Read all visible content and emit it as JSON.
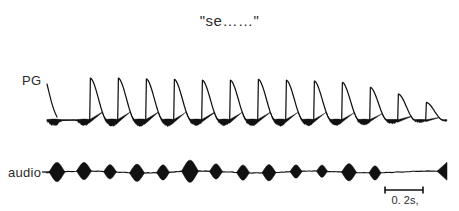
{
  "figure": {
    "title": "\"se……\"",
    "background_color": "#ffffff",
    "ink_color": "#111111",
    "traces": [
      {
        "name": "PG",
        "label": "PG",
        "type": "photoglottogram",
        "cycle_count": 14
      },
      {
        "name": "audio",
        "label": "audio",
        "type": "acoustic-waveform",
        "burst_count": 13
      }
    ],
    "scale_bar": {
      "label": "0. 2s,",
      "duration_seconds": 0.2,
      "x_start": 385,
      "x_end": 423,
      "y": 190
    }
  },
  "chart_data": {
    "type": "line",
    "title": "\"se……\"",
    "xlabel": "",
    "ylabel": "",
    "grid": false,
    "legend": "none",
    "x_scale_note": "0.2 s reference bar spans 38 px near right edge",
    "series": [
      {
        "name": "PG",
        "label": "PG",
        "baseline_y": 120,
        "peak_y": 78,
        "x_start": 47,
        "x_end": 447,
        "cycle_period_px": 28.5,
        "peak_x": [
          62,
          90,
          118,
          146,
          174,
          202,
          230,
          258,
          286,
          314,
          342,
          370,
          398,
          426
        ],
        "peak_amplitude": [
          0.0,
          1.0,
          1.0,
          0.98,
          0.97,
          0.95,
          0.95,
          0.97,
          0.95,
          0.93,
          0.9,
          0.78,
          0.62,
          0.42
        ],
        "closed_phase_thickness": [
          5.5,
          6.0,
          6.2,
          6.0,
          5.6,
          5.4,
          5.6,
          5.8,
          5.4,
          5.2,
          4.8,
          3.6,
          2.4,
          1.2
        ]
      },
      {
        "name": "audio",
        "label": "audio",
        "baseline_y": 172,
        "x_start": 46,
        "x_end": 447,
        "burst_x": [
          57,
          84,
          110,
          137,
          163,
          190,
          216,
          243,
          269,
          296,
          322,
          349,
          375
        ],
        "burst_half_height": [
          9.5,
          8.5,
          7.0,
          8.5,
          7.5,
          11.0,
          7.5,
          7.5,
          8.0,
          6.5,
          6.0,
          8.5,
          7.0
        ],
        "burst_half_width": [
          8.0,
          7.5,
          6.5,
          7.5,
          6.5,
          8.5,
          6.5,
          6.5,
          7.0,
          6.0,
          5.5,
          7.5,
          6.0
        ],
        "terminal_flare": {
          "x": 437,
          "half_height": 9.0,
          "width": 10.0
        }
      }
    ]
  }
}
